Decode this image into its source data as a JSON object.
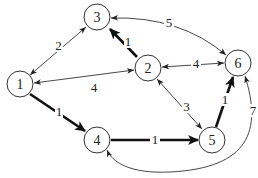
{
  "diagram": {
    "type": "directed-weighted-graph",
    "nodes": [
      {
        "id": "1",
        "label": "1",
        "x": 20,
        "y": 84
      },
      {
        "id": "2",
        "label": "2",
        "x": 148,
        "y": 68
      },
      {
        "id": "3",
        "label": "3",
        "x": 97,
        "y": 17
      },
      {
        "id": "4",
        "label": "4",
        "x": 97,
        "y": 140
      },
      {
        "id": "5",
        "label": "5",
        "x": 212,
        "y": 140
      },
      {
        "id": "6",
        "label": "6",
        "x": 238,
        "y": 63
      }
    ],
    "edges": [
      {
        "from": "1",
        "to": "3",
        "weight": "2",
        "bold": false,
        "bidirectional": true
      },
      {
        "from": "1",
        "to": "2",
        "weight": "4",
        "bold": false,
        "bidirectional": true
      },
      {
        "from": "2",
        "to": "3",
        "weight": "1",
        "bold": true,
        "bidirectional": false
      },
      {
        "from": "6",
        "to": "3",
        "weight": "5",
        "bold": false,
        "bidirectional": true,
        "curved": true
      },
      {
        "from": "2",
        "to": "6",
        "weight": "4",
        "bold": false,
        "bidirectional": true
      },
      {
        "from": "2",
        "to": "5",
        "weight": "3",
        "bold": false,
        "bidirectional": true
      },
      {
        "from": "1",
        "to": "4",
        "weight": "1",
        "bold": true,
        "bidirectional": false
      },
      {
        "from": "4",
        "to": "5",
        "weight": "1",
        "bold": true,
        "bidirectional": false
      },
      {
        "from": "5",
        "to": "6",
        "weight": "1",
        "bold": true,
        "bidirectional": false
      },
      {
        "from": "6",
        "to": "4",
        "weight": "7",
        "bold": false,
        "bidirectional": true,
        "curved": true
      }
    ]
  }
}
